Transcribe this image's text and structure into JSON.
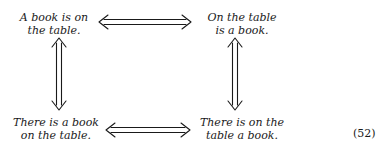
{
  "diagram": {
    "nodes": {
      "top_left": {
        "line1": "A book is on",
        "line2": "the table."
      },
      "top_right": {
        "line1": "On the table",
        "line2": "is a book."
      },
      "bottom_left": {
        "line1": "There is a book",
        "line2": "on the table."
      },
      "bottom_right": {
        "line1": "There is on the",
        "line2": "table a book."
      }
    },
    "edges": [
      {
        "from": "top_left",
        "to": "top_right",
        "type": "double-headed-double-arrow",
        "orientation": "horizontal"
      },
      {
        "from": "bottom_left",
        "to": "bottom_right",
        "type": "double-headed-double-arrow",
        "orientation": "horizontal"
      },
      {
        "from": "top_left",
        "to": "bottom_left",
        "type": "double-headed-double-arrow",
        "orientation": "vertical"
      },
      {
        "from": "top_right",
        "to": "bottom_right",
        "type": "double-headed-double-arrow",
        "orientation": "vertical"
      }
    ],
    "equation_number": "(52)"
  }
}
